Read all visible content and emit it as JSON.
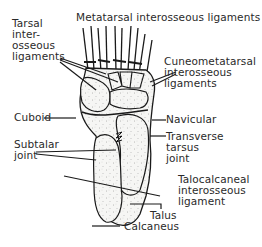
{
  "diagram": {
    "labels": {
      "tarsal_interosseous": "Tarsal\ninter-\nosseous\nligaments",
      "metatarsal_interosseous": "Metatarsal interosseous ligaments",
      "cuneometatarsal": "Cuneometatarsal\ninterosseous\nligaments",
      "cuboid": "Cuboid",
      "navicular": "Navicular",
      "subtalar_joint": "Subtalar\njoint",
      "transverse_tarsus_joint": "Transverse\ntarsus\njoint",
      "talocalcaneal": "Talocalcaneal\ninterosseous\nligament",
      "talus": "Talus",
      "calcaneus": "Calcaneus"
    },
    "colors": {
      "ink": "#1a1a1a",
      "bone_fill": "#f4f4f2",
      "background": "#ffffff"
    }
  }
}
